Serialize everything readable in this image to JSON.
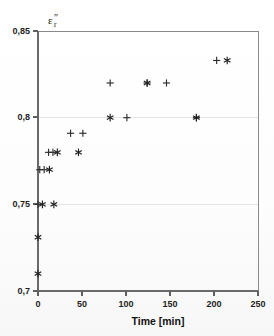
{
  "figure": {
    "name": "relative-permittivity-loss-vs-time-scatter"
  },
  "chart_data": {
    "type": "scatter",
    "title": "",
    "subtitle": "",
    "xlabel": "Time [min]",
    "ylabel": "ε",
    "ylabel_sub": "r",
    "ylabel_prime": "″",
    "ylabel_full": "ε″r",
    "xlim": [
      0,
      250
    ],
    "ylim": [
      0.7,
      0.85
    ],
    "xticks": [
      0,
      50,
      100,
      150,
      200,
      250
    ],
    "xtick_labels": [
      "0",
      "50",
      "100",
      "150",
      "200",
      "250"
    ],
    "yticks": [
      0.7,
      0.75,
      0.8,
      0.85
    ],
    "ytick_labels": [
      "0,7",
      "0,75",
      "0,8",
      "0,85"
    ],
    "grid": "horizontal-at-0.75-and-0.8",
    "grid_values": [
      0.75,
      0.8
    ],
    "legend": "none",
    "legend_position": "none",
    "decimal_separator": ",",
    "series": [
      {
        "name": "series-plus",
        "marker": "plus",
        "color": "#2e2e2e",
        "points": [
          {
            "x": 0,
            "y": 0.75
          },
          {
            "x": 2,
            "y": 0.77
          },
          {
            "x": 7,
            "y": 0.77
          },
          {
            "x": 12,
            "y": 0.78
          },
          {
            "x": 17,
            "y": 0.78
          },
          {
            "x": 37,
            "y": 0.791
          },
          {
            "x": 51,
            "y": 0.791
          },
          {
            "x": 82,
            "y": 0.82
          },
          {
            "x": 101,
            "y": 0.8
          },
          {
            "x": 124,
            "y": 0.82
          },
          {
            "x": 146,
            "y": 0.82
          },
          {
            "x": 180,
            "y": 0.8
          },
          {
            "x": 203,
            "y": 0.833
          }
        ]
      },
      {
        "name": "series-star",
        "marker": "star",
        "color": "#1f1f1f",
        "points": [
          {
            "x": 0,
            "y": 0.71
          },
          {
            "x": 0,
            "y": 0.731
          },
          {
            "x": 5,
            "y": 0.75
          },
          {
            "x": 18,
            "y": 0.75
          },
          {
            "x": 13,
            "y": 0.77
          },
          {
            "x": 22,
            "y": 0.78
          },
          {
            "x": 46,
            "y": 0.78
          },
          {
            "x": 82,
            "y": 0.8
          },
          {
            "x": 124,
            "y": 0.82
          },
          {
            "x": 180,
            "y": 0.8
          },
          {
            "x": 215,
            "y": 0.833
          }
        ]
      }
    ]
  },
  "geometry": {
    "plot_left": 38,
    "plot_right": 258,
    "plot_top": 31,
    "plot_bottom": 291
  }
}
